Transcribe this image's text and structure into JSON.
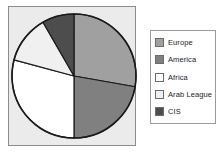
{
  "chart_data": {
    "type": "pie",
    "title": "",
    "subtitle": "",
    "xlabel": "",
    "ylabel": "",
    "legend_position": "right",
    "grid": false,
    "start_angle_deg": 0,
    "direction": "clockwise",
    "categories": [
      "Europe",
      "America",
      "Africa",
      "Arab League",
      "CIS"
    ],
    "values": [
      27.8,
      22.2,
      29.2,
      12.5,
      8.3
    ],
    "units": "percent",
    "slice_angles_deg": [
      100,
      80,
      105,
      45,
      30
    ],
    "colors": [
      "#a0a0a0",
      "#808080",
      "#ffffff",
      "#f0f0f0",
      "#4d4d4d"
    ],
    "slices": [
      {
        "label": "Europe",
        "value": 27.8,
        "angle_deg": 100,
        "color": "#a0a0a0"
      },
      {
        "label": "America",
        "value": 22.2,
        "angle_deg": 80,
        "color": "#808080"
      },
      {
        "label": "Africa",
        "value": 29.2,
        "angle_deg": 105,
        "color": "#ffffff"
      },
      {
        "label": "Arab League",
        "value": 12.5,
        "angle_deg": 45,
        "color": "#f0f0f0"
      },
      {
        "label": "CIS",
        "value": 8.3,
        "angle_deg": 30,
        "color": "#4d4d4d"
      }
    ]
  },
  "legend": {
    "items": [
      {
        "label": "Europe",
        "color": "#a0a0a0"
      },
      {
        "label": "America",
        "color": "#808080"
      },
      {
        "label": "Africa",
        "color": "#ffffff"
      },
      {
        "label": "Arab League",
        "color": "#f0f0f0"
      },
      {
        "label": "CIS",
        "color": "#4d4d4d"
      }
    ]
  },
  "style": {
    "plot_background": "#ebebeb",
    "plot_border": "#8c8c8c",
    "legend_background": "#ffffff",
    "legend_border": "#9a9a9a",
    "slice_outline": "#1a1a1a",
    "page_background": "#ffffff"
  }
}
